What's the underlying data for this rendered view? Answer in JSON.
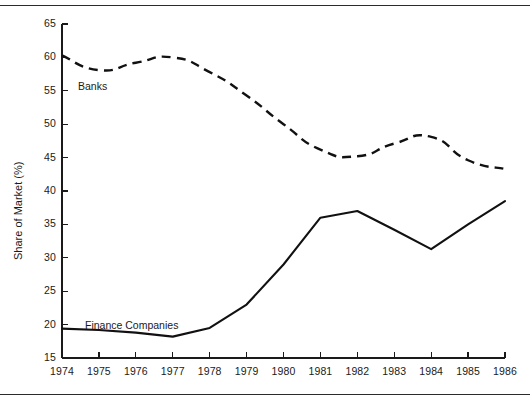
{
  "chart_data": {
    "type": "line",
    "title": "",
    "xlabel": "",
    "ylabel": "Share of Market (%)",
    "categories": [
      "1974",
      "1975",
      "1976",
      "1977",
      "1978",
      "1979",
      "1980",
      "1981",
      "1982",
      "1983",
      "1984",
      "1985",
      "1986"
    ],
    "x": [
      1974,
      1975,
      1976,
      1977,
      1978,
      1979,
      1980,
      1981,
      1982,
      1983,
      1984,
      1985,
      1986
    ],
    "xlim": [
      1974,
      1986
    ],
    "ylim": [
      15,
      65
    ],
    "yticks": [
      15,
      20,
      25,
      30,
      35,
      40,
      45,
      50,
      55,
      60,
      65
    ],
    "ytick_labels": [
      "15",
      "20",
      "25",
      "30",
      "35",
      "40",
      "45",
      "50",
      "55",
      "60",
      "65"
    ],
    "grid": false,
    "legend_position": "inline-annotation",
    "series": [
      {
        "name": "Banks",
        "style": "dashed",
        "color": "#111111",
        "values": [
          60.3,
          58.1,
          59.2,
          60.0,
          57.8,
          54.3,
          50.0,
          46.2,
          45.2,
          47.1,
          48.1,
          44.6,
          43.3
        ]
      },
      {
        "name": "Finance Companies",
        "style": "solid",
        "color": "#111111",
        "values": [
          19.4,
          19.2,
          18.8,
          18.2,
          19.5,
          23.0,
          29.0,
          36.0,
          37.0,
          34.2,
          31.3,
          35.0,
          38.5
        ]
      }
    ],
    "annotations": [
      {
        "text": "Banks",
        "x_px": 78,
        "y_px": 80
      },
      {
        "text": "Finance Companies",
        "x_px": 85,
        "y_px": 319
      }
    ]
  }
}
